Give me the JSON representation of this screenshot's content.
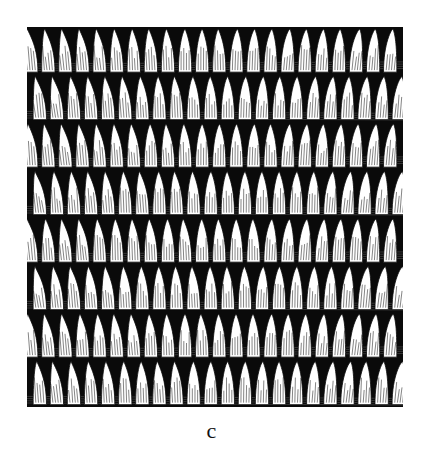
{
  "figure": {
    "caption": "c",
    "rows": 8,
    "stitches_per_row": 22,
    "colors": {
      "ink": "#0a0a0a",
      "paper": "#ffffff"
    }
  }
}
